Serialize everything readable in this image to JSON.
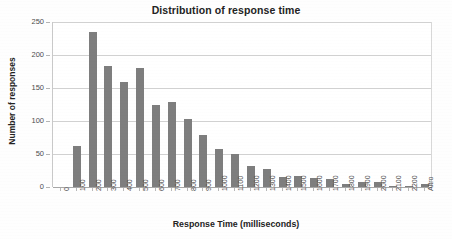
{
  "chart_data": {
    "type": "bar",
    "title": "Distribution of response time",
    "xlabel": "Response Time (milliseconds)",
    "ylabel": "Number of responses",
    "categories": [
      "0",
      "100",
      "200",
      "300",
      "400",
      "500",
      "600",
      "700",
      "800",
      "900",
      "1000",
      "1100",
      "1200",
      "1300",
      "1400",
      "1500",
      "1600",
      "1700",
      "1800",
      "1900",
      "2000",
      "2100",
      "2200",
      "Altro"
    ],
    "values": [
      0,
      62,
      235,
      184,
      159,
      180,
      125,
      129,
      103,
      79,
      58,
      50,
      32,
      28,
      15,
      17,
      14,
      12,
      4,
      8,
      8,
      2,
      2,
      5
    ],
    "ylim": [
      0,
      250
    ],
    "yticks": [
      "0",
      "50",
      "100",
      "150",
      "200",
      "250"
    ],
    "ytick_values": [
      0,
      50,
      100,
      150,
      200,
      250
    ],
    "grid": true,
    "legend": "none",
    "bar_color": "#7e7e7e",
    "grid_color": "#d2d2d2",
    "axis_color": "#a8a8a8",
    "background_color": "#ffffff",
    "text_color": "#232323"
  }
}
